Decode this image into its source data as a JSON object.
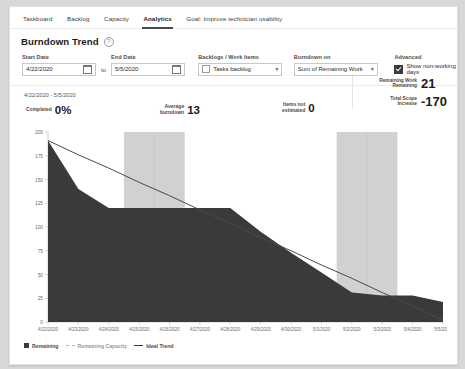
{
  "tabs": [
    {
      "label": "Taskboard",
      "active": false
    },
    {
      "label": "Backlog",
      "active": false
    },
    {
      "label": "Capacity",
      "active": false
    },
    {
      "label": "Analytics",
      "active": true
    },
    {
      "label": "Goal: Improve technician usability",
      "active": false
    }
  ],
  "header": {
    "title": "Burndown Trend",
    "help_icon": "question-circle-icon"
  },
  "filters": {
    "start_date": {
      "label": "Start Date",
      "value": "4/22/2020",
      "icon": "calendar-icon"
    },
    "to_label": "to",
    "end_date": {
      "label": "End Date",
      "value": "5/5/2020",
      "icon": "calendar-icon"
    },
    "backlog": {
      "label": "Backlogs / Work Items",
      "value": "Tasks backlog",
      "icon": "grid-icon",
      "chevron": "chevron-down-icon"
    },
    "burndown_on": {
      "label": "Burndown on",
      "value": "Sum of Remaining Work",
      "chevron": "chevron-down-icon"
    },
    "advanced": {
      "label": "Advanced",
      "checkbox_label": "Show non-working days",
      "checked": true
    }
  },
  "summary": {
    "date_range": "4/22/2020 - 5/5/2020",
    "completed": {
      "label": "Completed",
      "value": "0%"
    },
    "average_burndown": {
      "label_line1": "Average",
      "label_line2": "burndown",
      "value": "13"
    },
    "items_not_estimated": {
      "label_line1": "Items not",
      "label_line2": "estimated",
      "value": "0"
    },
    "remaining_work": {
      "label_line1": "Remaining Work",
      "label_line2": "Remaining",
      "value": "21"
    },
    "total_scope": {
      "label_line1": "Total Scope",
      "label_line2": "Increase",
      "value": "-170"
    }
  },
  "legend": [
    {
      "name": "Remaining",
      "style": "swatch"
    },
    {
      "name": "Remaining Capacity",
      "style": "dashed"
    },
    {
      "name": "Ideal Trend",
      "style": "solid"
    }
  ],
  "colors": {
    "remaining_area": "#3a3a3a",
    "ideal_trend": "#4a4a4a",
    "non_working_band": "#c9c9c9",
    "axis": "#cfcfcf",
    "accent": "#4a4a4a"
  },
  "chart_data": {
    "type": "area",
    "title": "Burndown Trend",
    "xlabel": "",
    "ylabel": "",
    "ylim": [
      0,
      200
    ],
    "yticks": [
      0,
      25,
      50,
      75,
      100,
      125,
      150,
      175,
      200
    ],
    "grid": false,
    "legend_position": "bottom-left",
    "categories": [
      "4/22/2020",
      "4/23/2020",
      "4/24/2020",
      "4/25/2020",
      "4/26/2020",
      "4/27/2020",
      "4/28/2020",
      "4/29/2020",
      "4/30/2020",
      "5/1/2020",
      "5/2/2020",
      "5/3/2020",
      "5/4/2020",
      "5/5/2020"
    ],
    "series": [
      {
        "name": "Remaining",
        "type": "area",
        "values": [
          191,
          140,
          120,
          120,
          120,
          120,
          120,
          95,
          73,
          52,
          31,
          28,
          28,
          21
        ]
      },
      {
        "name": "Ideal Trend",
        "type": "line",
        "values": [
          191,
          176,
          162,
          147,
          133,
          118,
          104,
          89,
          75,
          60,
          46,
          31,
          17,
          2
        ]
      }
    ],
    "non_working_days": [
      "4/25/2020",
      "4/26/2020",
      "5/2/2020",
      "5/3/2020"
    ],
    "annotations": {
      "completed": "0%",
      "average_burndown": "13",
      "items_not_estimated": "0",
      "remaining_work_remaining": "21",
      "total_scope_increase": "-170"
    }
  }
}
